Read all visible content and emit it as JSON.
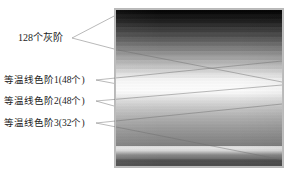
{
  "figure": {
    "background_color": "#ffffff",
    "leader_line_color": "#8a8a8a",
    "text_color": "#1b1b1b"
  },
  "labels": [
    {
      "id": "gray-levels",
      "text": "128个灰阶",
      "count": 128,
      "description": "gray-levels-label"
    },
    {
      "id": "isotherm-scale-1",
      "text": "等温线色阶1(48个)",
      "count": 48,
      "description": "isotherm-color-scale-1-label"
    },
    {
      "id": "isotherm-scale-2",
      "text": "等温线色阶2(48个)",
      "count": 48,
      "description": "isotherm-color-scale-2-label"
    },
    {
      "id": "isotherm-scale-3",
      "text": "等温线色阶3(32个)",
      "count": 32,
      "description": "isotherm-color-scale-3-label"
    }
  ],
  "gradient_image": {
    "name": "grayscale-isotherm-strip",
    "x": 115,
    "y": 9,
    "width": 168,
    "height": 158,
    "border_color": "#bdbdbd",
    "orientation": "vertical",
    "top_color": "#050505",
    "bottom_color": "#4a4a4a",
    "peak_brightness_color": "#fcfcfc",
    "peak_brightness_position_pct": 51.5,
    "secondary_highlight_color": "#e4e4e4",
    "secondary_highlight_position_pct": 88.4
  },
  "leaders": {
    "gray_levels": [
      {
        "x1": 72,
        "y1": 38,
        "x2": 116,
        "y2": 14
      },
      {
        "x1": 72,
        "y1": 38,
        "x2": 116,
        "y2": 50
      }
    ],
    "scale_1": [
      {
        "x1": 96,
        "y1": 80,
        "x2": 282,
        "y2": 61
      },
      {
        "x1": 96,
        "y1": 80,
        "x2": 160,
        "y2": 92
      }
    ],
    "scale_2": [
      {
        "x1": 96,
        "y1": 101,
        "x2": 282,
        "y2": 85
      },
      {
        "x1": 96,
        "y1": 101,
        "x2": 150,
        "y2": 116
      }
    ],
    "scale_3": [
      {
        "x1": 96,
        "y1": 123,
        "x2": 282,
        "y2": 104
      },
      {
        "x1": 96,
        "y1": 123,
        "x2": 283,
        "y2": 160
      }
    ]
  }
}
